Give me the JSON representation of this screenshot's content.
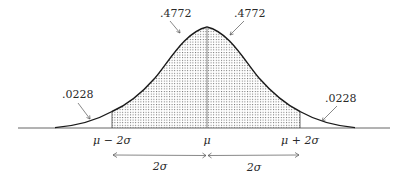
{
  "diagram": {
    "type": "normal-distribution",
    "areas": {
      "left_tail": ".0228",
      "left_center": ".4772",
      "right_center": ".4772",
      "right_tail": ".0228"
    },
    "axis_labels": {
      "left": "μ − 2σ",
      "center": "μ",
      "right": "μ + 2σ"
    },
    "intervals": {
      "left": "2σ",
      "right": "2σ"
    },
    "colors": {
      "curve": "#1a1a1a",
      "shade_dots": "#555555",
      "axis": "#555555",
      "text": "#2a2a2a"
    }
  }
}
